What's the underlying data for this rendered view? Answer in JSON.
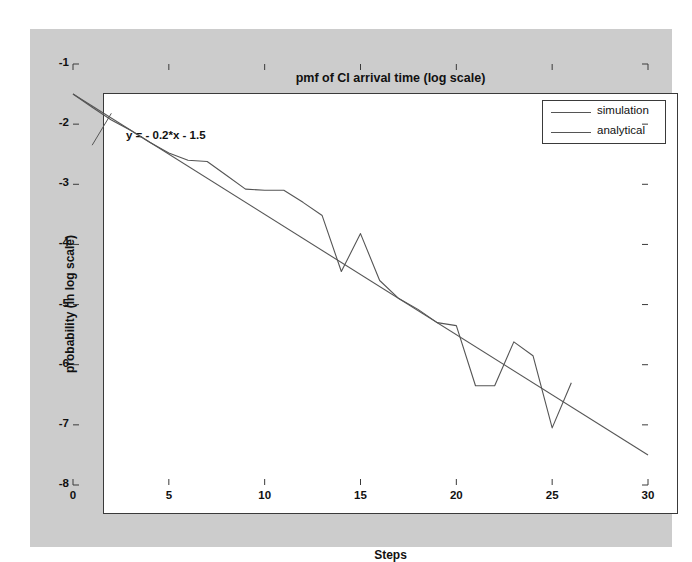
{
  "figure": {
    "background_color": "#cccccc",
    "axes_background_color": "#ffffff",
    "axes_edge_color": "#3a3a3a"
  },
  "annotation": {
    "equation": "y = - 0.2*x - 1.5"
  },
  "legend": {
    "entries": [
      {
        "label": "simulation",
        "color": "#555555"
      },
      {
        "label": "analytical",
        "color": "#555555"
      }
    ]
  },
  "chart_data": {
    "type": "line",
    "title": "pmf of CI arrival time (log scale)",
    "xlabel": "Steps",
    "ylabel": "probability (in log scale)",
    "xlim": [
      0,
      30
    ],
    "ylim": [
      -8,
      -1
    ],
    "xticks": [
      0,
      5,
      10,
      15,
      20,
      25,
      30
    ],
    "yticks": [
      -1,
      -2,
      -3,
      -4,
      -5,
      -6,
      -7,
      -8
    ],
    "xticklabels": [
      "0",
      "5",
      "10",
      "15",
      "20",
      "25",
      "30"
    ],
    "yticklabels": [
      "-1",
      "-2",
      "-3",
      "-4",
      "-5",
      "-6",
      "-7",
      "-8"
    ],
    "grid": false,
    "legend_position": "upper right",
    "annotations": [
      {
        "text": "y = - 0.2*x - 1.5",
        "x": 2.0,
        "y": -1.82
      }
    ],
    "series": [
      {
        "name": "simulation",
        "color": "#555555",
        "x": [
          0,
          1,
          2,
          3,
          4,
          5,
          6,
          7,
          8,
          9,
          10,
          11,
          12,
          13,
          14,
          15,
          16,
          17,
          18,
          19,
          20,
          21,
          22,
          23,
          24,
          25,
          26
        ],
        "y": [
          -1.5,
          -1.72,
          -1.93,
          -2.1,
          -2.3,
          -2.48,
          -2.6,
          -2.62,
          -2.85,
          -3.08,
          -3.1,
          -3.1,
          -3.3,
          -3.52,
          -4.45,
          -3.82,
          -4.6,
          -4.9,
          -5.08,
          -5.3,
          -5.35,
          -6.35,
          -6.35,
          -5.62,
          -5.85,
          -7.05,
          -6.3
        ]
      },
      {
        "name": "analytical",
        "color": "#555555",
        "x": [
          0,
          30
        ],
        "y": [
          -1.5,
          -7.5
        ]
      }
    ],
    "leader_line": {
      "x": [
        2.0,
        1.0
      ],
      "y": [
        -1.82,
        -2.35
      ]
    }
  }
}
